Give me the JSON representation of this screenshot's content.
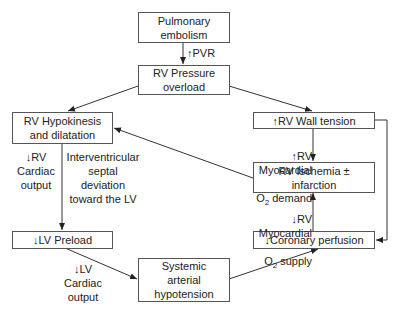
{
  "diagram": {
    "nodes": {
      "pe": {
        "label": "Pulmonary\nembolism"
      },
      "rvpo": {
        "label": "RV Pressure\noverload"
      },
      "rvhd": {
        "label": "RV Hypokinesis\nand dilatation"
      },
      "rvwt": {
        "label": "↑RV Wall tension"
      },
      "rvi": {
        "label": "RV Ischemia ±\ninfarction"
      },
      "lvp": {
        "label": "↓LV Preload"
      },
      "cp": {
        "label": "↓Coronary perfusion"
      },
      "sah": {
        "label": "Systemic\narterial\nhypotension"
      }
    },
    "edge_labels": {
      "pvr": "↑PVR",
      "rvco": "↓RV\nCardiac\noutput",
      "septal": "Interventricular\nseptal deviation\ntoward the LV",
      "o2demand_1": "↑RV Myocardial",
      "o2demand_2": "O",
      "o2demand_sub": "2",
      "o2demand_3": " demand",
      "o2supply_1": "↓RV Myocardial",
      "o2supply_2": "O",
      "o2supply_sub": "2",
      "o2supply_3": " supply",
      "lvco": "↓LV\nCardiac\noutput"
    },
    "edges": [
      [
        "pe",
        "rvpo"
      ],
      [
        "rvpo",
        "rvhd"
      ],
      [
        "rvpo",
        "rvwt"
      ],
      [
        "rvwt",
        "rvi"
      ],
      [
        "rvi",
        "rvhd"
      ],
      [
        "rvhd",
        "lvp"
      ],
      [
        "lvp",
        "sah"
      ],
      [
        "sah",
        "cp"
      ],
      [
        "cp",
        "rvi"
      ],
      [
        "rvwt",
        "cp"
      ]
    ]
  }
}
